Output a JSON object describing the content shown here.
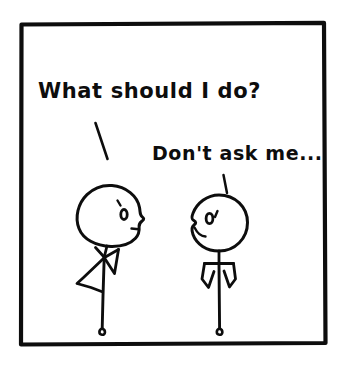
{
  "comic": {
    "title": "Two stick figures conversation comic panel",
    "panel": {
      "background_color": "#ffffff",
      "ink_color": "#0d0d0d",
      "border_width_px": 4,
      "x": 20,
      "y": 22,
      "width": 306,
      "height": 323
    },
    "dialogue": [
      {
        "id": "line-1",
        "speaker": "left-figure",
        "text": "What should I do?",
        "x": 38,
        "y": 98,
        "font_size": 21,
        "pointer": "diagonal-tick"
      },
      {
        "id": "line-2",
        "speaker": "right-figure",
        "text": "Don't ask me...",
        "x": 152,
        "y": 160,
        "font_size": 19,
        "pointer": "vertical-tick"
      }
    ],
    "figures": [
      {
        "id": "left-figure",
        "name": "left-stick-figure",
        "pose": "looking-up-questioning",
        "facing": "right",
        "head_shape": "egg-oval",
        "head_cx": 108,
        "head_cy": 215,
        "head_rx": 31,
        "head_ry": 30,
        "eye": {
          "cx": 124,
          "cy": 214,
          "rx": 3.4,
          "ry": 5.0
        },
        "eyebrow": "short-tick-upper-left",
        "nose": "pointed-right-profile",
        "mouth": "small-line",
        "arms": "shrug-bent",
        "legs": 1,
        "foot": "small-loop",
        "leg_x": 104,
        "ground_y": 333
      },
      {
        "id": "right-figure",
        "name": "right-stick-figure",
        "pose": "shrugging",
        "facing": "left",
        "head_shape": "round",
        "head_cx": 219,
        "head_cy": 223,
        "head_rx": 28,
        "head_ry": 28,
        "eye": {
          "cx": 210,
          "cy": 218,
          "rx": 3.6,
          "ry": 5.2
        },
        "eyebrow": "short-tick-upper-right",
        "nose": "pointed-left-profile",
        "mouth": "small-curve",
        "arms": "double-v-shrug",
        "legs": 1,
        "foot": "small-loop",
        "leg_x": 219,
        "ground_y": 333
      }
    ],
    "pointers": [
      {
        "id": "pointer-left",
        "name": "speech-pointer-left",
        "x1": 96,
        "y1": 124,
        "x2": 107,
        "y2": 158
      },
      {
        "id": "pointer-right",
        "name": "speech-pointer-right",
        "x1": 224,
        "y1": 176,
        "x2": 227,
        "y2": 192
      }
    ]
  }
}
